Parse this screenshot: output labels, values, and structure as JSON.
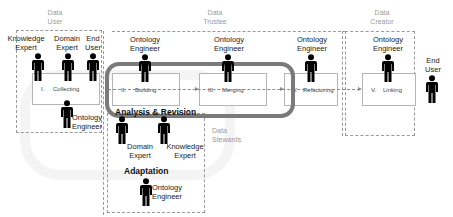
{
  "zones": {
    "data_user": "Data\nUser",
    "data_trustee": "Data\nTrustee",
    "data_creator": "Data\nCreator",
    "data_stewards": "Data\nStewards"
  },
  "zone_labels": {
    "data_user_1": "Data",
    "data_user_2": "User",
    "data_trustee_1": "Data",
    "data_trustee_2": "Trustee",
    "data_creator_1": "Data",
    "data_creator_2": "Creator",
    "data_stewards_1": "Data",
    "data_stewards_2": "Stewards"
  },
  "roles": {
    "knowledge_expert_1": "Knowledge",
    "knowledge_expert_2": "Expert",
    "domain_expert_1": "Domain",
    "domain_expert_2": "Expert",
    "end_user_1": "End",
    "end_user_2": "User",
    "collect_oe_1": "Ontology",
    "collect_oe_2": "Engineer",
    "build_oe_1": "Ontology",
    "build_oe_2": "Engineer",
    "merge_oe_1": "Ontology",
    "merge_oe_2": "Engineer",
    "refactor_oe_1": "Ontology",
    "refactor_oe_2": "Engineer",
    "link_oe_1": "Ontology",
    "link_oe_2": "Engineer",
    "end_user_right_1": "End",
    "end_user_right_2": "User",
    "ar_domain_1": "Domain",
    "ar_domain_2": "Expert",
    "ar_knowledge_1": "Knowledge",
    "ar_knowledge_2": "Expert",
    "adapt_oe_1": "Ontology",
    "adapt_oe_2": "Engineer"
  },
  "stages": {
    "collecting_num": "I.",
    "collecting": "Collecting",
    "building_num": "II.",
    "building": "Building",
    "merging_num": "III.",
    "merging": "Merging",
    "refactoring_num": "IV.",
    "refactoring": "Refactoring",
    "linking_num": "V.",
    "linking": "Linking"
  },
  "sections": {
    "analysis_revision": "Analysis & Revision",
    "adaptation": "Adaptation"
  },
  "icons": {
    "person": "person-icon"
  },
  "colors": {
    "dashed_border": "#9a9a9a",
    "loop_border": "#7a7a7a",
    "person_fill": "#000000",
    "zone_text": "#9a9a9a"
  }
}
